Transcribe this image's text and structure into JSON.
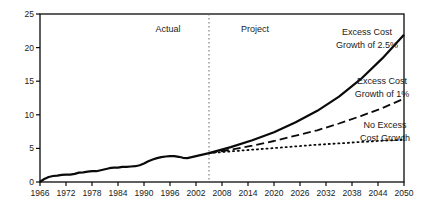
{
  "colors": {
    "line": "#0a0a0a",
    "divider": "#666666",
    "text": "#1a1a1a",
    "background": "#ffffff"
  },
  "chart_data": {
    "type": "line",
    "title": "",
    "xlabel": "",
    "ylabel": "",
    "x_range": [
      1966,
      2050
    ],
    "y_range": [
      0,
      25
    ],
    "x_ticks": [
      1966,
      1972,
      1978,
      1984,
      1990,
      1996,
      2002,
      2008,
      2014,
      2020,
      2026,
      2032,
      2038,
      2044,
      2050
    ],
    "y_ticks": [
      0,
      5,
      10,
      15,
      20,
      25
    ],
    "grid": false,
    "legend_position": "inline-annotations",
    "divider": {
      "year": 2005,
      "style": "dotted-vertical"
    },
    "series": [
      {
        "name": "Actual",
        "style": "solid",
        "points": [
          [
            1966,
            0.05
          ],
          [
            1967,
            0.45
          ],
          [
            1968,
            0.75
          ],
          [
            1969,
            0.9
          ],
          [
            1970,
            0.95
          ],
          [
            1971,
            1.05
          ],
          [
            1972,
            1.1
          ],
          [
            1973,
            1.1
          ],
          [
            1974,
            1.2
          ],
          [
            1975,
            1.4
          ],
          [
            1976,
            1.45
          ],
          [
            1977,
            1.55
          ],
          [
            1978,
            1.6
          ],
          [
            1979,
            1.6
          ],
          [
            1980,
            1.75
          ],
          [
            1981,
            1.9
          ],
          [
            1982,
            2.05
          ],
          [
            1983,
            2.15
          ],
          [
            1984,
            2.15
          ],
          [
            1985,
            2.25
          ],
          [
            1986,
            2.25
          ],
          [
            1987,
            2.3
          ],
          [
            1988,
            2.35
          ],
          [
            1989,
            2.5
          ],
          [
            1990,
            2.75
          ],
          [
            1991,
            3.1
          ],
          [
            1992,
            3.35
          ],
          [
            1993,
            3.55
          ],
          [
            1994,
            3.7
          ],
          [
            1995,
            3.8
          ],
          [
            1996,
            3.85
          ],
          [
            1997,
            3.85
          ],
          [
            1998,
            3.75
          ],
          [
            1999,
            3.6
          ],
          [
            2000,
            3.55
          ],
          [
            2001,
            3.7
          ],
          [
            2002,
            3.85
          ],
          [
            2003,
            4.0
          ],
          [
            2004,
            4.15
          ],
          [
            2005,
            4.3
          ]
        ]
      },
      {
        "name": "Excess Cost Growth of 2.5%",
        "style": "solid",
        "points": [
          [
            2005,
            4.3
          ],
          [
            2010,
            5.2
          ],
          [
            2015,
            6.2
          ],
          [
            2020,
            7.4
          ],
          [
            2025,
            8.9
          ],
          [
            2030,
            10.6
          ],
          [
            2035,
            12.7
          ],
          [
            2040,
            15.3
          ],
          [
            2045,
            18.4
          ],
          [
            2050,
            21.9
          ]
        ]
      },
      {
        "name": "Excess Cost Growth of 1%",
        "style": "dashed",
        "points": [
          [
            2005,
            4.3
          ],
          [
            2010,
            4.8
          ],
          [
            2015,
            5.4
          ],
          [
            2020,
            6.1
          ],
          [
            2025,
            6.9
          ],
          [
            2030,
            7.7
          ],
          [
            2035,
            8.7
          ],
          [
            2040,
            9.8
          ],
          [
            2045,
            11.0
          ],
          [
            2050,
            12.4
          ]
        ]
      },
      {
        "name": "No Excess Cost Growth",
        "style": "dotted",
        "points": [
          [
            2005,
            4.3
          ],
          [
            2010,
            4.55
          ],
          [
            2015,
            4.8
          ],
          [
            2020,
            5.05
          ],
          [
            2025,
            5.3
          ],
          [
            2030,
            5.55
          ],
          [
            2035,
            5.75
          ],
          [
            2040,
            5.95
          ],
          [
            2045,
            6.15
          ],
          [
            2050,
            6.3
          ]
        ]
      }
    ],
    "annotations": [
      {
        "id": "actual-label",
        "lines": [
          "Actual"
        ],
        "x": 168,
        "y": 32,
        "line_height": 13
      },
      {
        "id": "project-label",
        "lines": [
          "Project"
        ],
        "x": 255,
        "y": 32,
        "line_height": 13
      },
      {
        "id": "excess-2-5-label",
        "lines": [
          "Excess Cost",
          "Growth of 2.5%"
        ],
        "x": 367,
        "y": 35,
        "line_height": 13
      },
      {
        "id": "excess-1-label",
        "lines": [
          "Excess Cost",
          "Growth of 1%"
        ],
        "x": 382,
        "y": 84,
        "line_height": 13
      },
      {
        "id": "no-excess-label",
        "lines": [
          "No Excess",
          "Cost Growth"
        ],
        "x": 385,
        "y": 128,
        "line_height": 13
      }
    ]
  }
}
